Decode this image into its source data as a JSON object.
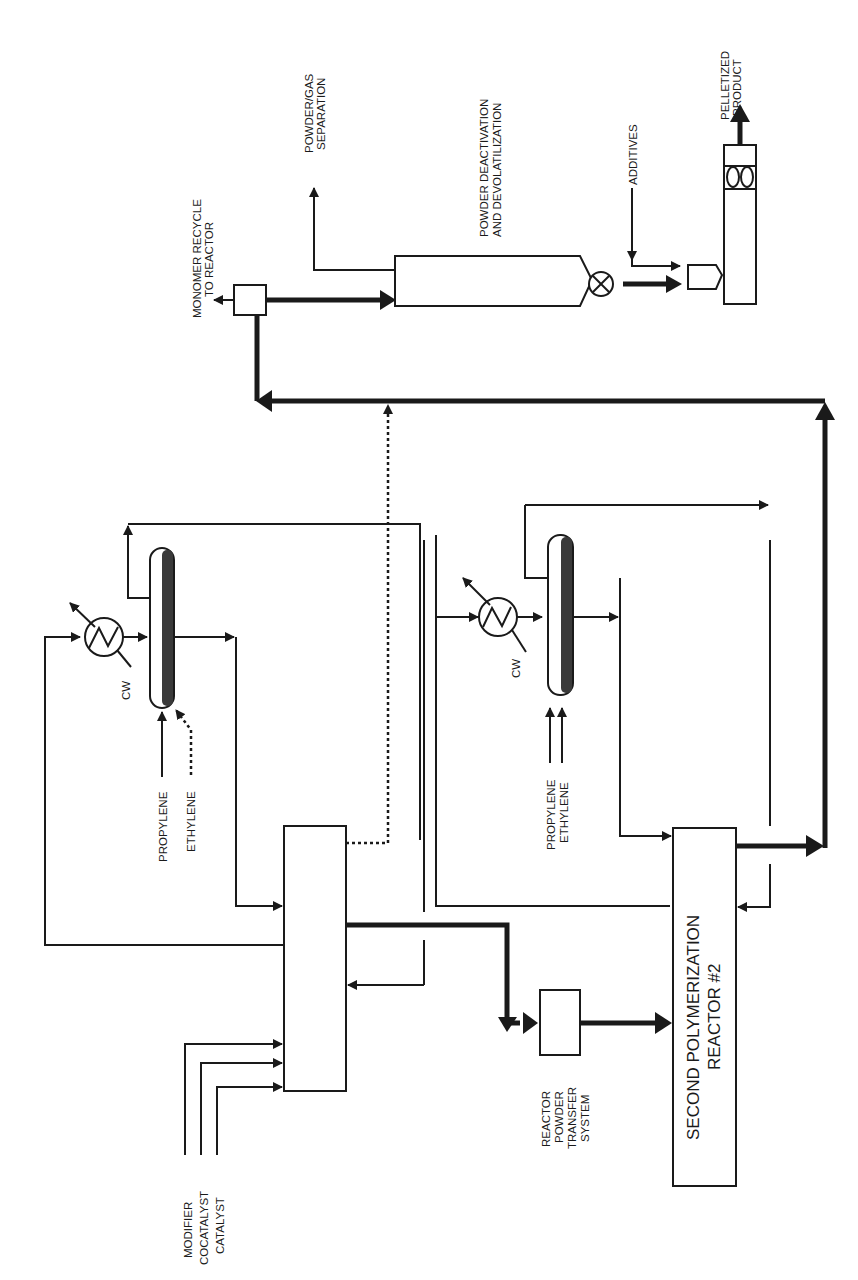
{
  "diagram": {
    "type": "process-flow-diagram",
    "orientation": "rotated-90-ccw",
    "colors": {
      "line": "#1a1a1a",
      "background": "#ffffff",
      "vessel_fill": "#3a3a3a"
    }
  },
  "labels": {
    "feeds": {
      "modifier": "MODIFIER",
      "cocatalyst": "COCATALYST",
      "catalyst": "CATALYST"
    },
    "reactor1_feeds": {
      "propylene": "PROPYLENE",
      "ethylene": "ETHYLENE"
    },
    "reactor2_feeds": {
      "propylene": "PROPYLENE",
      "ethylene": "ETHYLENE"
    },
    "cooling_water_1": "CW",
    "cooling_water_2": "CW",
    "transfer_system": [
      "REACTOR",
      "POWDER",
      "TRANSFER",
      "SYSTEM"
    ],
    "second_reactor": [
      "SECOND POLYMERIZATION",
      "REACTOR #2"
    ],
    "monomer_recycle": [
      "MONOMER RECYCLE",
      "TO REACTOR"
    ],
    "powder_gas_separation": [
      "POWDER/GAS",
      "SEPARATION"
    ],
    "powder_deactivation": [
      "POWDER DEACTIVATION",
      "AND DEVOLATILIZATION"
    ],
    "additives": "ADDITIVES",
    "pelletized_product": [
      "PELLETIZED",
      "PRODUCT"
    ]
  },
  "units": [
    {
      "id": "reactor-1",
      "name": "First polymerization reactor"
    },
    {
      "id": "drum-1",
      "name": "Reactor 1 flash drum"
    },
    {
      "id": "exchanger-1",
      "name": "Reactor 1 heat exchanger"
    },
    {
      "id": "transfer-system",
      "name": "Reactor powder transfer system"
    },
    {
      "id": "reactor-2",
      "name": "Second polymerization reactor #2"
    },
    {
      "id": "drum-2",
      "name": "Reactor 2 flash drum"
    },
    {
      "id": "exchanger-2",
      "name": "Reactor 2 heat exchanger"
    },
    {
      "id": "separator",
      "name": "Powder/gas separation"
    },
    {
      "id": "deactivation-vessel",
      "name": "Powder deactivation and devolatilization"
    },
    {
      "id": "rotary-valve",
      "name": "Rotary valve"
    },
    {
      "id": "extruder",
      "name": "Pelletizing extruder"
    }
  ]
}
